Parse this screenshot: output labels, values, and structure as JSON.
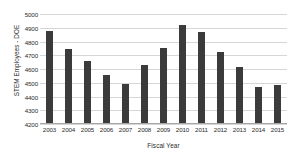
{
  "chart_data": {
    "type": "bar",
    "title": "",
    "xlabel": "Fiscal Year",
    "ylabel": "STEM Employees - DOE",
    "categories": [
      "2003",
      "2004",
      "2005",
      "2006",
      "2007",
      "2008",
      "2009",
      "2010",
      "2011",
      "2012",
      "2013",
      "2014",
      "2015"
    ],
    "values": [
      4876,
      4742,
      4660,
      4556,
      4494,
      4626,
      4754,
      4918,
      4866,
      4722,
      4614,
      4466,
      4486
    ],
    "ylim": [
      4200,
      5000
    ],
    "yticks": [
      "4200",
      "4300",
      "4400",
      "4500",
      "4600",
      "4700",
      "4800",
      "4900",
      "5000"
    ],
    "ytick_values": [
      4200,
      4300,
      4400,
      4500,
      4600,
      4700,
      4800,
      4900,
      5000
    ],
    "grid": true,
    "legend": "none",
    "bar_color": "#3b3b3b",
    "gridline_color": "#d6d6d6",
    "axis_color": "#a6a6a6",
    "text_color": "#2b2b2b"
  }
}
